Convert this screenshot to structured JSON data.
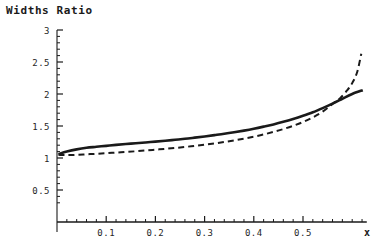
{
  "title": "Widths Ratio",
  "chart_data": {
    "type": "line",
    "title": "Widths Ratio",
    "xlabel": "x",
    "ylabel": "",
    "xlim": [
      0.0,
      0.6215
    ],
    "ylim": [
      0.28,
      3.0
    ],
    "grid": false,
    "legend": "none",
    "x_ticks_major": [
      0.1,
      0.2,
      0.3,
      0.4,
      0.5
    ],
    "x_tick_labels": [
      "0.1",
      "0.2",
      "0.3",
      "0.4",
      "0.5"
    ],
    "x_ticks_minor_step": 0.02,
    "y_ticks_major": [
      0.5,
      1,
      1.5,
      2,
      2.5,
      3
    ],
    "y_tick_labels": [
      "0.5",
      "1",
      "1.5",
      "2",
      "2.5",
      "3"
    ],
    "y_ticks_minor_step": 0.1,
    "axis_color": "#1a1a1a",
    "series": [
      {
        "name": "solid-curve",
        "style": "solid",
        "color": "#1a1a1a",
        "width": 2.6,
        "x": [
          0.003,
          0.02,
          0.04,
          0.06,
          0.08,
          0.1,
          0.12,
          0.14,
          0.16,
          0.18,
          0.2,
          0.22,
          0.24,
          0.26,
          0.28,
          0.3,
          0.32,
          0.34,
          0.36,
          0.38,
          0.4,
          0.42,
          0.44,
          0.46,
          0.48,
          0.5,
          0.52,
          0.54,
          0.56,
          0.58,
          0.6,
          0.6215
        ],
        "y": [
          1.06,
          1.1,
          1.135,
          1.16,
          1.175,
          1.19,
          1.205,
          1.218,
          1.23,
          1.243,
          1.256,
          1.27,
          1.285,
          1.3,
          1.318,
          1.337,
          1.357,
          1.378,
          1.402,
          1.428,
          1.457,
          1.49,
          1.525,
          1.565,
          1.61,
          1.66,
          1.715,
          1.78,
          1.85,
          1.925,
          2.0,
          2.06
        ]
      },
      {
        "name": "dashed-curve",
        "style": "dashed",
        "color": "#1a1a1a",
        "width": 2.0,
        "dash": "6 4",
        "x": [
          0.003,
          0.02,
          0.04,
          0.06,
          0.08,
          0.1,
          0.12,
          0.14,
          0.16,
          0.18,
          0.2,
          0.22,
          0.24,
          0.26,
          0.28,
          0.3,
          0.32,
          0.34,
          0.36,
          0.38,
          0.4,
          0.42,
          0.44,
          0.46,
          0.48,
          0.5,
          0.52,
          0.54,
          0.56,
          0.575,
          0.59,
          0.6,
          0.61,
          0.6185
        ],
        "y": [
          1.05,
          1.045,
          1.05,
          1.058,
          1.066,
          1.075,
          1.085,
          1.095,
          1.105,
          1.117,
          1.13,
          1.143,
          1.157,
          1.172,
          1.19,
          1.208,
          1.228,
          1.25,
          1.275,
          1.302,
          1.333,
          1.368,
          1.408,
          1.452,
          1.503,
          1.562,
          1.635,
          1.725,
          1.845,
          1.93,
          2.06,
          2.17,
          2.34,
          2.63
        ]
      }
    ],
    "annotations": []
  },
  "axes": {
    "x_axis_label": "x",
    "origin_px": [
      57,
      222
    ]
  }
}
